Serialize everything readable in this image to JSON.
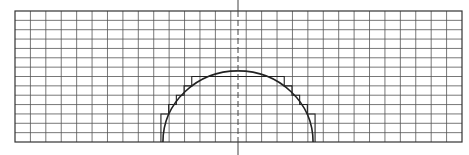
{
  "diagram": {
    "type": "grid-arc-approximation",
    "grid": {
      "columns": 29,
      "rows": 14
    },
    "arc": {
      "shape": "semicircle",
      "orientation": "upward",
      "radius_cells_x": 4.87,
      "radius_cells_y": 7.6
    },
    "staircase": {
      "present": true
    },
    "axis_of_symmetry": {
      "style": "dashed",
      "orientation": "vertical"
    },
    "colors": {
      "line": "#333333",
      "grid": "#555555",
      "background": "#ffffff"
    }
  }
}
